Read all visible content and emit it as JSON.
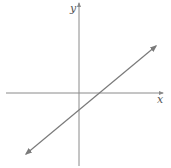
{
  "diagram": {
    "type": "coordinate-plane-line-graph",
    "axes": {
      "x_label": "x",
      "y_label": "y"
    },
    "line": {
      "description": "straight line with positive slope, arrows at both ends",
      "x_intercept": "positive",
      "y_intercept": "negative"
    },
    "colors": {
      "axis": "#8a8a8a",
      "line": "#7a7a7a",
      "label": "#555555",
      "background": "#ffffff"
    }
  }
}
